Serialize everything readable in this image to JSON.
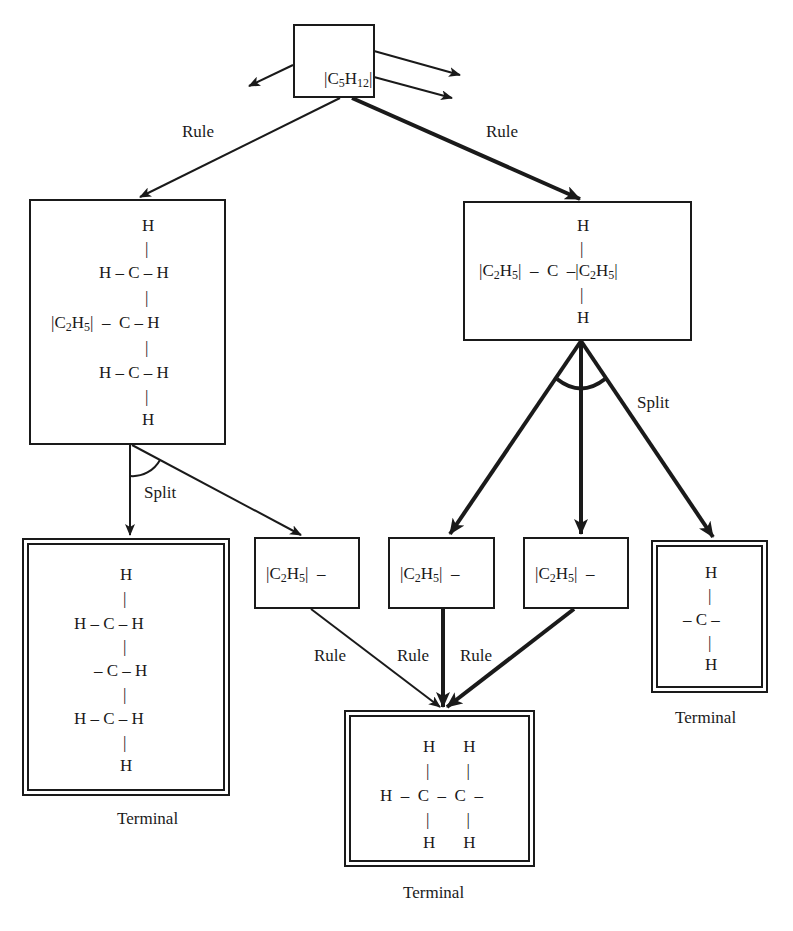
{
  "diagram": {
    "type": "AND/OR problem-reduction graph",
    "root": {
      "id": "root",
      "label_parts": [
        "|C",
        "5",
        "H",
        "12",
        "|"
      ],
      "label": "|C5H12|"
    },
    "edge_labels": {
      "rule": "Rule",
      "split": "Split",
      "terminal": "Terminal"
    },
    "nodes": [
      {
        "id": "left",
        "kind": "expansion",
        "rows": [
          "H",
          "|",
          "H – C – H",
          "|",
          "|C2H5| – C – H",
          "|",
          "H – C – H",
          "|",
          "H"
        ]
      },
      {
        "id": "right",
        "kind": "expansion",
        "rows": [
          "H",
          "|",
          "|C2H5| – C –|C2H5|",
          "|",
          "H"
        ]
      },
      {
        "id": "left-terminal",
        "kind": "terminal",
        "rows": [
          "H",
          "|",
          "H – C – H",
          "|",
          "– C – H",
          "|",
          "H – C – H",
          "|",
          "H"
        ],
        "caption": "Terminal"
      },
      {
        "id": "c2h5-a",
        "kind": "subproblem",
        "label": "|C2H5| –"
      },
      {
        "id": "c2h5-b",
        "kind": "subproblem",
        "label": "|C2H5| –"
      },
      {
        "id": "c2h5-c",
        "kind": "subproblem",
        "label": "|C2H5| –"
      },
      {
        "id": "right-terminal",
        "kind": "terminal",
        "rows": [
          "H",
          "|",
          "– C –",
          "|",
          "H"
        ],
        "caption": "Terminal"
      },
      {
        "id": "bottom-terminal",
        "kind": "terminal",
        "rows": [
          "H     H",
          "|      |",
          "H – C – C –",
          "|      |",
          "H     H"
        ],
        "caption": "Terminal"
      }
    ],
    "edges": [
      {
        "from": "root",
        "to": "left",
        "label": "Rule",
        "weight": "thin"
      },
      {
        "from": "root",
        "to": "right",
        "label": "Rule",
        "weight": "thick"
      },
      {
        "from": "root",
        "to": "off-left",
        "label": "",
        "weight": "thin"
      },
      {
        "from": "root",
        "to": "off-right-1",
        "label": "",
        "weight": "thin"
      },
      {
        "from": "root",
        "to": "off-right-2",
        "label": "",
        "weight": "thin"
      },
      {
        "from": "left",
        "to": "left-terminal",
        "label": "Split",
        "weight": "thin",
        "and_group": "left-split"
      },
      {
        "from": "left",
        "to": "c2h5-a",
        "label": "Split",
        "weight": "thin",
        "and_group": "left-split"
      },
      {
        "from": "right",
        "to": "c2h5-b",
        "label": "Split",
        "weight": "thick",
        "and_group": "right-split"
      },
      {
        "from": "right",
        "to": "c2h5-c",
        "label": "Split",
        "weight": "thick",
        "and_group": "right-split"
      },
      {
        "from": "right",
        "to": "right-terminal",
        "label": "Split",
        "weight": "thick",
        "and_group": "right-split"
      },
      {
        "from": "c2h5-a",
        "to": "bottom-terminal",
        "label": "Rule",
        "weight": "thin"
      },
      {
        "from": "c2h5-b",
        "to": "bottom-terminal",
        "label": "Rule",
        "weight": "thick"
      },
      {
        "from": "c2h5-c",
        "to": "bottom-terminal",
        "label": "Rule",
        "weight": "thick"
      }
    ]
  },
  "colors": {
    "ink": "#1a1a1a",
    "background": "#ffffff"
  }
}
